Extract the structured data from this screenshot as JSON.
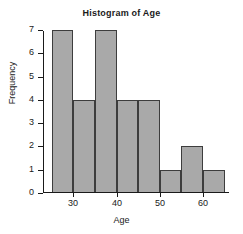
{
  "chart_data": {
    "type": "bar",
    "title": "Histogram of Age",
    "xlabel": "Age",
    "ylabel": "Frequency",
    "bin_width": 5,
    "bin_edges": [
      25,
      30,
      35,
      40,
      45,
      50,
      55,
      60,
      65
    ],
    "categories": [
      "25-30",
      "30-35",
      "35-40",
      "40-45",
      "45-50",
      "50-55",
      "55-60",
      "60-65"
    ],
    "values": [
      7,
      4,
      7,
      4,
      4,
      1,
      2,
      1
    ],
    "xlim": [
      23,
      66
    ],
    "ylim": [
      0,
      7
    ],
    "xticks": [
      30,
      40,
      50,
      60
    ],
    "xtick_labels": [
      "30",
      "40",
      "50",
      "60"
    ],
    "yticks": [
      0,
      1,
      2,
      3,
      4,
      5,
      6,
      7
    ],
    "ytick_labels": [
      "0",
      "1",
      "2",
      "3",
      "4",
      "5",
      "6",
      "7"
    ],
    "grid": false,
    "legend": "none",
    "bar_fill_color": "#a9a9a9",
    "bar_edge_color": "#3d3d3d",
    "axis_color": "#1a1a1a",
    "background_color": "#ffffff"
  }
}
